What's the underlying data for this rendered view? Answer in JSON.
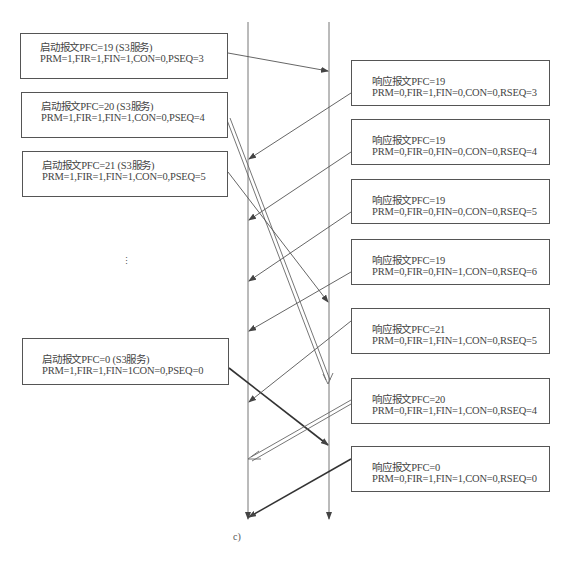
{
  "diagram": {
    "caption": "c)",
    "ellipsis": "⋮",
    "lifelines": [
      {
        "name": "left-lifeline",
        "x": 248
      },
      {
        "name": "right-lifeline",
        "x": 329
      }
    ],
    "requests": [
      {
        "title": "启动报文PFC=19 (S3服务)",
        "params": "PRM=1,FIR=1,FIN=1,CON=0,PSEQ=3"
      },
      {
        "title": "启动报文PFC=20 (S3服务)",
        "params": "PRM=1,FIR=1,FIN=1,CON=0,PSEQ=4"
      },
      {
        "title": "启动报文PFC=21 (S3服务)",
        "params": "PRM=1,FIR=1,FIN=1,CON=0,PSEQ=5"
      },
      {
        "title": "启动报文PFC=0 (S3服务)",
        "params": "PRM=1,FIR=1,FIN=1CON=0,PSEQ=0"
      }
    ],
    "responses": [
      {
        "title": "响应报文PFC=19",
        "params": "PRM=0,FIR=1,FIN=0,CON=0,RSEQ=3"
      },
      {
        "title": "响应报文PFC=19",
        "params": "PRM=0,FIR=0,FIN=0,CON=0,RSEQ=4"
      },
      {
        "title": "响应报文PFC=19",
        "params": "PRM=0,FIR=0,FIN=0,CON=0,RSEQ=5"
      },
      {
        "title": "响应报文PFC=19",
        "params": "PRM=0,FIR=0,FIN=1,CON=0,RSEQ=6"
      },
      {
        "title": "响应报文PFC=21",
        "params": "PRM=0,FIR=1,FIN=1,CON=0,RSEQ=5"
      },
      {
        "title": "响应报文PFC=20",
        "params": "PRM=0,FIR=1,FIN=1,CON=0,RSEQ=4"
      },
      {
        "title": "响应报文PFC=0",
        "params": "PRM=0,FIR=1,FIN=1,CON=0,RSEQ=0"
      }
    ],
    "colors": {
      "line": "#555555",
      "text": "#444444",
      "thick": "#333333"
    }
  }
}
